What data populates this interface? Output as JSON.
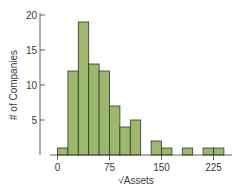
{
  "chart_data": {
    "type": "bar",
    "title": "",
    "xlabel": "√Assets",
    "ylabel": "# of Companies",
    "bin_width": 15,
    "bin_edges": [
      0,
      15,
      30,
      45,
      60,
      75,
      90,
      105,
      120,
      135,
      150,
      165,
      180,
      195,
      210,
      225,
      240
    ],
    "categories": [
      "0-15",
      "15-30",
      "30-45",
      "45-60",
      "60-75",
      "75-90",
      "90-105",
      "105-120",
      "120-135",
      "135-150",
      "150-165",
      "165-180",
      "180-195",
      "195-210",
      "210-225",
      "225-240"
    ],
    "values": [
      1,
      12,
      19,
      13,
      12,
      7,
      4,
      5,
      0,
      2,
      1,
      0,
      1,
      0,
      1,
      1
    ],
    "xticks": [
      0,
      75,
      150,
      225
    ],
    "yticks": [
      5,
      10,
      15,
      20
    ],
    "xlim": [
      0,
      250
    ],
    "ylim": [
      0,
      20
    ],
    "grid": false,
    "colors": {
      "bar_fill": "#9db86e",
      "bar_stroke": "#2e3a22",
      "axis": "#3a3a3a"
    }
  }
}
